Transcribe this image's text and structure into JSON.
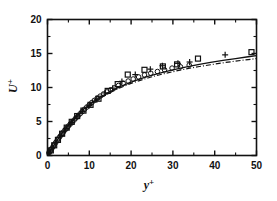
{
  "figure": {
    "background_color": "#ffffff",
    "foreground_color": "#111111"
  },
  "axes": {
    "x_title_base": "y",
    "x_title_sup": "+",
    "y_title_base": "U",
    "y_title_sup": "+",
    "x_tick_labels": [
      "0",
      "10",
      "20",
      "30",
      "40",
      "50"
    ],
    "y_tick_labels": [
      "0",
      "5",
      "10",
      "15",
      "20"
    ]
  },
  "chart_data": {
    "type": "scatter",
    "title": "",
    "xlabel": "y+",
    "ylabel": "U+",
    "xlim": [
      0,
      50
    ],
    "ylim": [
      0,
      20
    ],
    "xticks": [
      0,
      10,
      20,
      30,
      40,
      50
    ],
    "yticks": [
      0,
      5,
      10,
      15,
      20
    ],
    "x_minor_ticks": [
      5,
      15,
      25,
      35,
      45
    ],
    "y_minor_ticks": [
      2.5,
      7.5,
      12.5,
      17.5
    ],
    "grid": false,
    "legend": "none",
    "frame": "box",
    "series": [
      {
        "name": "circle-markers",
        "marker": "circle",
        "points": [
          [
            0.35,
            0.35
          ],
          [
            0.6,
            0.6
          ],
          [
            0.85,
            0.85
          ],
          [
            1.1,
            1.1
          ],
          [
            1.4,
            1.38
          ],
          [
            1.7,
            1.66
          ],
          [
            2.0,
            1.94
          ],
          [
            2.35,
            2.25
          ],
          [
            2.7,
            2.56
          ],
          [
            3.05,
            2.86
          ],
          [
            3.4,
            3.15
          ],
          [
            3.8,
            3.45
          ],
          [
            4.2,
            3.76
          ],
          [
            4.6,
            4.05
          ],
          [
            5.0,
            4.33
          ],
          [
            5.45,
            4.62
          ],
          [
            5.9,
            4.9
          ],
          [
            6.35,
            5.2
          ],
          [
            6.8,
            5.5
          ],
          [
            7.3,
            5.82
          ],
          [
            7.8,
            6.14
          ],
          [
            8.3,
            6.45
          ],
          [
            8.85,
            6.8
          ],
          [
            9.4,
            7.12
          ],
          [
            10.0,
            7.45
          ],
          [
            10.6,
            7.78
          ],
          [
            11.2,
            8.1
          ],
          [
            11.9,
            8.42
          ],
          [
            12.6,
            8.73
          ],
          [
            13.4,
            9.05
          ],
          [
            14.2,
            9.35
          ],
          [
            15.1,
            9.65
          ],
          [
            16.0,
            9.95
          ],
          [
            17.0,
            10.3
          ],
          [
            18.1,
            10.62
          ],
          [
            19.3,
            10.95
          ],
          [
            20.5,
            11.25
          ],
          [
            21.8,
            11.55
          ],
          [
            23.2,
            11.85
          ],
          [
            24.7,
            12.1
          ],
          [
            26.3,
            12.35
          ],
          [
            28.0,
            12.6
          ],
          [
            29.8,
            12.85
          ],
          [
            31.8,
            13.05
          ],
          [
            33.9,
            13.3
          ]
        ]
      },
      {
        "name": "square-markers",
        "marker": "square",
        "points": [
          [
            0.8,
            0.75
          ],
          [
            1.6,
            1.5
          ],
          [
            2.5,
            2.3
          ],
          [
            3.5,
            3.2
          ],
          [
            4.6,
            4.1
          ],
          [
            5.8,
            4.95
          ],
          [
            7.1,
            5.8
          ],
          [
            8.6,
            6.6
          ],
          [
            10.3,
            7.45
          ],
          [
            12.2,
            8.35
          ],
          [
            14.4,
            9.5
          ],
          [
            16.8,
            10.5
          ],
          [
            19.2,
            11.9
          ],
          [
            23.2,
            12.6
          ],
          [
            27.6,
            13.1
          ],
          [
            31.0,
            13.4
          ],
          [
            36.0,
            14.25
          ],
          [
            48.8,
            15.2
          ]
        ]
      },
      {
        "name": "plus-markers",
        "marker": "plus",
        "points": [
          [
            0.5,
            0.5
          ],
          [
            1.2,
            1.15
          ],
          [
            2.1,
            1.95
          ],
          [
            3.2,
            2.95
          ],
          [
            4.4,
            3.95
          ],
          [
            5.7,
            4.85
          ],
          [
            7.0,
            5.7
          ],
          [
            8.4,
            6.5
          ],
          [
            10.0,
            7.35
          ],
          [
            11.8,
            8.2
          ],
          [
            13.8,
            9.2
          ],
          [
            15.6,
            9.9
          ],
          [
            17.8,
            10.9
          ],
          [
            21.0,
            11.9
          ],
          [
            24.6,
            12.7
          ],
          [
            27.5,
            13.2
          ],
          [
            31.2,
            13.55
          ],
          [
            34.0,
            13.75
          ],
          [
            42.5,
            14.8
          ]
        ]
      }
    ],
    "curves": [
      {
        "name": "solid-fit-curve",
        "style": "solid",
        "points": [
          [
            0.0,
            0.0
          ],
          [
            0.5,
            0.5
          ],
          [
            1.0,
            0.99
          ],
          [
            1.5,
            1.47
          ],
          [
            2.0,
            1.94
          ],
          [
            2.5,
            2.4
          ],
          [
            3.0,
            2.85
          ],
          [
            3.5,
            3.28
          ],
          [
            4.0,
            3.7
          ],
          [
            4.5,
            4.1
          ],
          [
            5.0,
            4.48
          ],
          [
            6.0,
            5.2
          ],
          [
            7.0,
            5.85
          ],
          [
            8.0,
            6.44
          ],
          [
            9.0,
            6.98
          ],
          [
            10.0,
            7.47
          ],
          [
            11.0,
            7.92
          ],
          [
            12.0,
            8.34
          ],
          [
            13.0,
            8.72
          ],
          [
            14.0,
            9.08
          ],
          [
            15.0,
            9.41
          ],
          [
            16.5,
            9.87
          ],
          [
            18.0,
            10.29
          ],
          [
            20.0,
            10.78
          ],
          [
            22.0,
            11.22
          ],
          [
            24.0,
            11.62
          ],
          [
            26.0,
            11.98
          ],
          [
            28.0,
            12.3
          ],
          [
            30.0,
            12.6
          ],
          [
            33.0,
            13.0
          ],
          [
            36.0,
            13.36
          ],
          [
            39.0,
            13.69
          ],
          [
            42.0,
            13.99
          ],
          [
            45.0,
            14.26
          ],
          [
            48.0,
            14.52
          ],
          [
            50.0,
            14.68
          ]
        ]
      },
      {
        "name": "dashdot-fit-curve",
        "style": "dash-dot",
        "points": [
          [
            0.0,
            0.0
          ],
          [
            0.5,
            0.5
          ],
          [
            1.0,
            0.99
          ],
          [
            1.5,
            1.46
          ],
          [
            2.0,
            1.92
          ],
          [
            2.5,
            2.37
          ],
          [
            3.0,
            2.8
          ],
          [
            3.5,
            3.22
          ],
          [
            4.0,
            3.62
          ],
          [
            4.5,
            4.0
          ],
          [
            5.0,
            4.37
          ],
          [
            6.0,
            5.07
          ],
          [
            7.0,
            5.71
          ],
          [
            8.0,
            6.3
          ],
          [
            9.0,
            6.84
          ],
          [
            10.0,
            7.33
          ],
          [
            11.0,
            7.78
          ],
          [
            12.0,
            8.2
          ],
          [
            13.0,
            8.58
          ],
          [
            14.0,
            8.93
          ],
          [
            15.0,
            9.26
          ],
          [
            16.5,
            9.71
          ],
          [
            18.0,
            10.12
          ],
          [
            20.0,
            10.6
          ],
          [
            22.0,
            11.02
          ],
          [
            24.0,
            11.4
          ],
          [
            26.0,
            11.74
          ],
          [
            28.0,
            12.05
          ],
          [
            30.0,
            12.33
          ],
          [
            33.0,
            12.71
          ],
          [
            36.0,
            13.05
          ],
          [
            39.0,
            13.35
          ],
          [
            42.0,
            13.63
          ],
          [
            45.0,
            13.88
          ],
          [
            48.0,
            14.11
          ],
          [
            50.0,
            14.25
          ]
        ]
      }
    ]
  }
}
